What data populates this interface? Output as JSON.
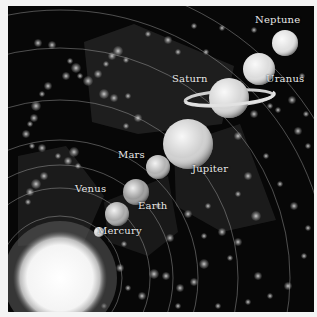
{
  "scene": {
    "title": "Solar System",
    "sun": {
      "name": "Sun",
      "cx": 52,
      "cy": 272,
      "r": 41,
      "glow_r": 57,
      "color": "#ffffff"
    },
    "orbits": [
      {
        "r": 62
      },
      {
        "r": 90
      },
      {
        "r": 113
      },
      {
        "r": 138
      },
      {
        "r": 178
      },
      {
        "r": 230
      },
      {
        "r": 268
      },
      {
        "r": 300
      }
    ],
    "sectors": [
      {
        "points": "76,36 126,18 226,60 214,118 130,128 84,116",
        "opacity": 0.18
      },
      {
        "points": "10,150 58,140 96,190 76,236 10,240",
        "opacity": 0.16
      },
      {
        "points": "166,140 232,118 268,214 214,226 168,200",
        "opacity": 0.16
      },
      {
        "points": "96,196 160,170 170,226 140,250 100,236",
        "opacity": 0.14
      }
    ],
    "planets": [
      {
        "name": "Mercury",
        "cx": 91,
        "cy": 226,
        "r": 5,
        "color": "#d8d8d8"
      },
      {
        "name": "Venus",
        "cx": 109,
        "cy": 208,
        "r": 12,
        "color": "#a9a9a9"
      },
      {
        "name": "Earth",
        "cx": 128,
        "cy": 186,
        "r": 13,
        "color": "#9a9a9a"
      },
      {
        "name": "Mars",
        "cx": 150,
        "cy": 161,
        "r": 12,
        "color": "#b3b3b3"
      },
      {
        "name": "Jupiter",
        "cx": 180,
        "cy": 138,
        "r": 25,
        "color": "#cfcfcf"
      },
      {
        "name": "Saturn",
        "cx": 221,
        "cy": 92,
        "r": 20,
        "color": "#d6d6d6",
        "ring": true
      },
      {
        "name": "Uranus",
        "cx": 251,
        "cy": 63,
        "r": 16,
        "color": "#dcdcdc"
      },
      {
        "name": "Neptune",
        "cx": 277,
        "cy": 37,
        "r": 13,
        "color": "#e0e0e0"
      }
    ],
    "labels": [
      {
        "text": "Mercury",
        "x": 97,
        "y": 225
      },
      {
        "text": "Venus",
        "x": 75,
        "y": 183
      },
      {
        "text": "Earth",
        "x": 138,
        "y": 200
      },
      {
        "text": "Mars",
        "x": 118,
        "y": 149
      },
      {
        "text": "Jupiter",
        "x": 192,
        "y": 163
      },
      {
        "text": "Saturn",
        "x": 172,
        "y": 73
      },
      {
        "text": "Uranus",
        "x": 266,
        "y": 73
      },
      {
        "text": "Neptune",
        "x": 255,
        "y": 14
      }
    ],
    "stars": [
      [
        30,
        37,
        4
      ],
      [
        44,
        39,
        4
      ],
      [
        62,
        55,
        3
      ],
      [
        68,
        62,
        5
      ],
      [
        58,
        70,
        4
      ],
      [
        72,
        70,
        3
      ],
      [
        80,
        75,
        5
      ],
      [
        90,
        68,
        4
      ],
      [
        98,
        58,
        3
      ],
      [
        104,
        50,
        4
      ],
      [
        110,
        45,
        5
      ],
      [
        118,
        54,
        3
      ],
      [
        96,
        88,
        5
      ],
      [
        106,
        92,
        4
      ],
      [
        120,
        90,
        3
      ],
      [
        40,
        80,
        4
      ],
      [
        34,
        88,
        3
      ],
      [
        28,
        100,
        5
      ],
      [
        26,
        112,
        4
      ],
      [
        22,
        118,
        3
      ],
      [
        18,
        128,
        4
      ],
      [
        24,
        140,
        3
      ],
      [
        34,
        142,
        4
      ],
      [
        50,
        150,
        3
      ],
      [
        60,
        155,
        4
      ],
      [
        70,
        160,
        3
      ],
      [
        36,
        170,
        4
      ],
      [
        28,
        178,
        5
      ],
      [
        22,
        186,
        4
      ],
      [
        20,
        196,
        3
      ],
      [
        66,
        146,
        5
      ],
      [
        140,
        28,
        3
      ],
      [
        160,
        34,
        4
      ],
      [
        170,
        46,
        3
      ],
      [
        198,
        46,
        3
      ],
      [
        230,
        130,
        4
      ],
      [
        246,
        108,
        4
      ],
      [
        262,
        100,
        3
      ],
      [
        270,
        104,
        3
      ],
      [
        284,
        94,
        4
      ],
      [
        298,
        108,
        3
      ],
      [
        290,
        125,
        4
      ],
      [
        300,
        140,
        3
      ],
      [
        240,
        170,
        4
      ],
      [
        258,
        150,
        3
      ],
      [
        272,
        178,
        3
      ],
      [
        286,
        200,
        4
      ],
      [
        248,
        210,
        5
      ],
      [
        230,
        236,
        4
      ],
      [
        214,
        226,
        4
      ],
      [
        196,
        258,
        5
      ],
      [
        186,
        276,
        4
      ],
      [
        172,
        282,
        4
      ],
      [
        158,
        270,
        4
      ],
      [
        146,
        268,
        5
      ],
      [
        134,
        290,
        4
      ],
      [
        120,
        282,
        3
      ],
      [
        112,
        262,
        4
      ],
      [
        116,
        238,
        3
      ],
      [
        180,
        208,
        4
      ],
      [
        200,
        200,
        3
      ],
      [
        222,
        252,
        3
      ],
      [
        250,
        270,
        4
      ],
      [
        262,
        290,
        3
      ],
      [
        280,
        280,
        4
      ],
      [
        296,
        250,
        3
      ],
      [
        300,
        222,
        3
      ],
      [
        210,
        300,
        3
      ],
      [
        240,
        296,
        3
      ],
      [
        170,
        300,
        3
      ],
      [
        96,
        300,
        3
      ],
      [
        294,
        70,
        3
      ],
      [
        246,
        24,
        3
      ],
      [
        214,
        22,
        3
      ],
      [
        186,
        20,
        3
      ],
      [
        150,
        200,
        3
      ],
      [
        162,
        232,
        4
      ],
      [
        196,
        230,
        3
      ],
      [
        230,
        188,
        3
      ],
      [
        130,
        112,
        4
      ],
      [
        118,
        120,
        3
      ]
    ]
  }
}
